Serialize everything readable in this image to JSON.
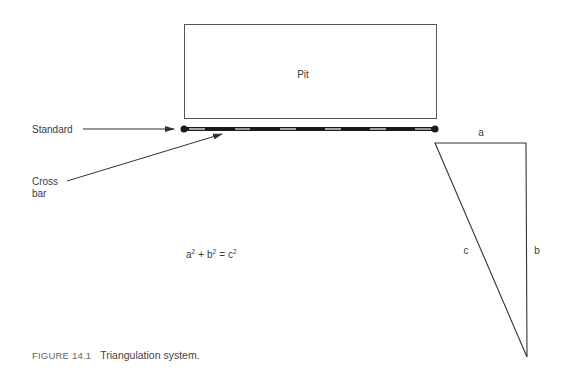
{
  "diagram": {
    "pit_label": "Pit",
    "standard_label": "Standard",
    "crossbar_label_line1": "Cross",
    "crossbar_label_line2": "bar",
    "equation": {
      "a": "a",
      "b": "b",
      "c": "c",
      "exp": "2",
      "plus": "+",
      "equals": "="
    },
    "triangle": {
      "side_a": "a",
      "side_b": "b",
      "side_c": "c"
    },
    "colors": {
      "line": "#333333",
      "bar": "#1a1a1a",
      "bar_mark": "#d9d9d9"
    }
  },
  "caption": {
    "figure_number": "FIGURE 14.1",
    "title": "Triangulation system."
  }
}
